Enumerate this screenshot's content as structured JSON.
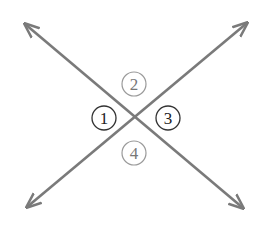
{
  "diagram": {
    "line_color": "#7a7a7a",
    "angles": [
      {
        "label": "1",
        "position": "left",
        "emphasis": "dark"
      },
      {
        "label": "2",
        "position": "top",
        "emphasis": "light"
      },
      {
        "label": "3",
        "position": "right",
        "emphasis": "dark"
      },
      {
        "label": "4",
        "position": "bottom",
        "emphasis": "light"
      }
    ]
  }
}
